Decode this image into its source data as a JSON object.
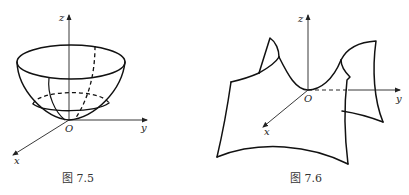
{
  "figures": [
    {
      "id": "fig-7-5",
      "caption": "图 7.5",
      "axes": {
        "z": "z",
        "y": "y",
        "x": "x",
        "origin": "O"
      },
      "surface": "paraboloid bowl"
    },
    {
      "id": "fig-7-6",
      "caption": "图 7.6",
      "axes": {
        "z": "z",
        "y": "y",
        "x": "x",
        "origin": "O"
      },
      "surface": "saddle (hyperbolic paraboloid)"
    }
  ],
  "colors": {
    "stroke": "#111111",
    "background": "#ffffff"
  }
}
